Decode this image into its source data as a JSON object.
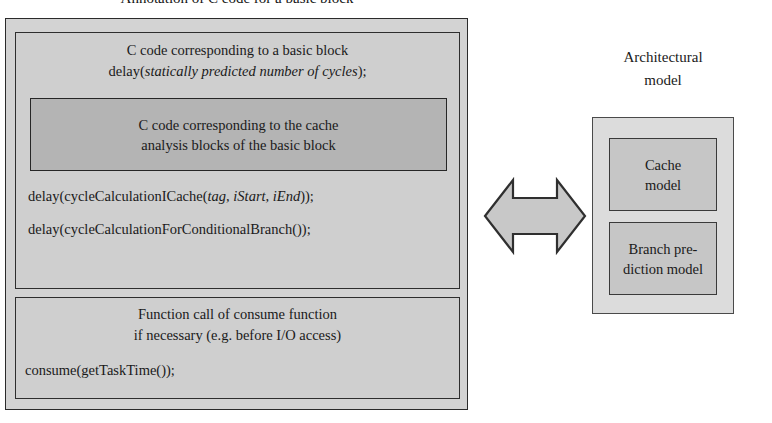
{
  "figure": {
    "title": "Annotation of C code for a basic block"
  },
  "annotation": {
    "basic_block": {
      "heading_line1": "C code corresponding to a basic block",
      "code_prefix": "delay(",
      "code_italic": "statically predicted number of cycles",
      "code_suffix": ");",
      "cache_analysis_line1": "C code corresponding to the cache",
      "cache_analysis_line2": "analysis blocks of the basic block",
      "icache_prefix": "delay(cycleCalculationICache(",
      "icache_italic": "tag, iStart, iEnd",
      "icache_suffix": "));",
      "branch_call": "delay(cycleCalculationForConditionalBranch());"
    },
    "consume": {
      "heading_line1": "Function call of consume function",
      "heading_line2": "if necessary (e.g. before I/O access)",
      "code": "consume(getTaskTime());"
    }
  },
  "arrow": {
    "icon": "double-headed-horizontal-arrow-icon"
  },
  "architectural": {
    "label_line1": "Architectural",
    "label_line2": "model",
    "cache_model": "Cache\nmodel",
    "cache_model_line1": "Cache",
    "cache_model_line2": "model",
    "branch_model_line1": "Branch pre-",
    "branch_model_line2": "diction model"
  },
  "colors": {
    "page_background": "#ffffff",
    "outer_frame_fill": "#d3d3d3",
    "inner_panel_fill": "#cfcfcf",
    "cache_block_fill": "#b4b4b4",
    "architectural_container_fill": "#dcdcdc",
    "model_box_fill": "#c6c6c6",
    "arrow_fill": "#c8c8c8",
    "border_dark": "#2b2b2b",
    "text": "#1a1a1a"
  }
}
